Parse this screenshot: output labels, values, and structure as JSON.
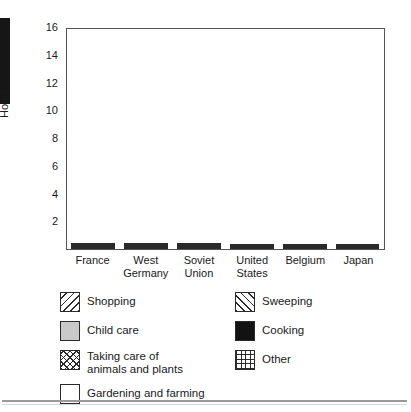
{
  "chart_data": {
    "type": "bar",
    "subtype": "stacked",
    "title": "",
    "xlabel": "",
    "ylabel": "Hours",
    "ylim": [
      0,
      16
    ],
    "yticks": [
      2,
      4,
      6,
      8,
      10,
      12,
      14,
      16
    ],
    "grid": false,
    "legend_position": "bottom",
    "categories": [
      "France",
      "West Germany",
      "Soviet Union",
      "United States",
      "Belgium",
      "Japan"
    ],
    "category_lines": [
      [
        "France"
      ],
      [
        "West",
        "Germany"
      ],
      [
        "Soviet",
        "Union"
      ],
      [
        "United",
        "States"
      ],
      [
        "Belgium"
      ],
      [
        "Japan"
      ]
    ],
    "series": [
      {
        "name": "Cooking",
        "key": "cooking",
        "values": [
          2.0,
          1.1,
          2.0,
          1.15,
          1.15,
          0.7
        ]
      },
      {
        "name": "Sweeping",
        "key": "sweeping",
        "values": [
          1.95,
          0.9,
          2.25,
          1.75,
          1.15,
          0.45
        ]
      },
      {
        "name": "Other",
        "key": "other",
        "values": [
          0.0,
          0.0,
          0.0,
          0.0,
          0.0,
          1.5
        ]
      },
      {
        "name": "Gardening and farming",
        "key": "gardening",
        "values": [
          5.55,
          4.6,
          4.35,
          4.4,
          5.9,
          0.0
        ]
      },
      {
        "name": "Taking care of animals and plants",
        "key": "animals",
        "values": [
          2.0,
          4.2,
          1.75,
          0.0,
          0.0,
          0.0
        ]
      },
      {
        "name": "Child care",
        "key": "childcare",
        "values": [
          1.4,
          1.35,
          1.55,
          1.5,
          0.7,
          1.15
        ]
      },
      {
        "name": "Shopping",
        "key": "shopping",
        "values": [
          1.95,
          1.55,
          1.65,
          3.05,
          1.25,
          0.65
        ]
      }
    ],
    "totals": [
      14.85,
      13.7,
      13.55,
      11.85,
      10.15,
      4.45
    ],
    "legend_entries": [
      {
        "label": "Shopping",
        "pattern": "diagonal-hatch-back"
      },
      {
        "label": "Sweeping",
        "pattern": "diagonal-hatch-forward"
      },
      {
        "label": "Child care",
        "pattern": "solid-gray",
        "color": "#c9c9c9"
      },
      {
        "label": "Cooking",
        "pattern": "solid-black",
        "color": "#121212"
      },
      {
        "label": "Taking care of",
        "label_line2": "animals and plants",
        "pattern": "diagonal-crosshatch"
      },
      {
        "label": "Other",
        "pattern": "grid-crosshatch"
      },
      {
        "label": "Gardening and farming",
        "pattern": "solid-white",
        "color": "#ffffff"
      }
    ]
  },
  "axis": {
    "y_title": "Hours",
    "y_tick_labels": [
      "16",
      "14",
      "12",
      "10",
      "8",
      "6",
      "4",
      "2"
    ]
  },
  "legend": {
    "shopping": "Shopping",
    "sweeping": "Sweeping",
    "child_care": "Child care",
    "cooking": "Cooking",
    "animals_line1": "Taking care of",
    "animals_line2": "animals and plants",
    "other": "Other",
    "gardening": "Gardening and farming"
  },
  "colors": {
    "ink": "#2a2a2a",
    "child_care_gray": "#c9c9c9",
    "cooking_black": "#121212",
    "frame": "#555555",
    "page_background": "#ffffff"
  }
}
